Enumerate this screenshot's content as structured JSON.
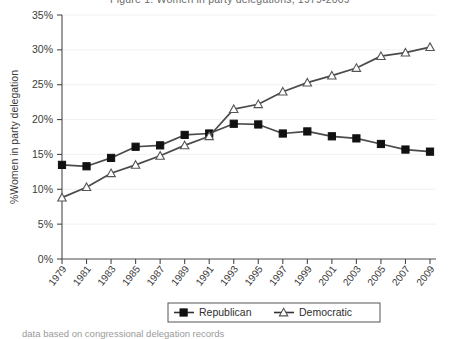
{
  "figure": {
    "title_fragment": "Figure 1. Women in party delegations, 1979-2009",
    "caption_fragment": "data based on congressional delegation records"
  },
  "chart_data": {
    "type": "line",
    "title": "",
    "xlabel": "",
    "ylabel": "%Women in party delegation",
    "x": [
      1979,
      1981,
      1983,
      1985,
      1987,
      1989,
      1991,
      1993,
      1995,
      1997,
      1999,
      2001,
      2003,
      2005,
      2007,
      2009
    ],
    "xtick_labels": [
      "1979",
      "1981",
      "1983",
      "1985",
      "1987",
      "1989",
      "1991",
      "1993",
      "1995",
      "1997",
      "1999",
      "2001",
      "2003",
      "2005",
      "2007",
      "2009"
    ],
    "ytick_labels": [
      "0%",
      "5%",
      "10%",
      "15%",
      "20%",
      "25%",
      "30%",
      "35%"
    ],
    "ytick_values": [
      0,
      5,
      10,
      15,
      20,
      25,
      30,
      35
    ],
    "ylim": [
      0,
      35
    ],
    "xlim": [
      1979,
      2009
    ],
    "grid": true,
    "legend_position": "bottom-center",
    "series": [
      {
        "name": "Republican",
        "marker": "filled-square",
        "color": "#4a4a4a",
        "values": [
          13.5,
          13.3,
          14.5,
          16.1,
          16.3,
          17.8,
          18.0,
          19.4,
          19.3,
          18.0,
          18.3,
          17.6,
          17.3,
          16.5,
          15.7,
          15.4
        ]
      },
      {
        "name": "Democratic",
        "marker": "open-triangle",
        "color": "#4a4a4a",
        "values": [
          8.8,
          10.3,
          12.3,
          13.5,
          14.8,
          16.3,
          17.6,
          21.5,
          22.2,
          24.0,
          25.3,
          26.3,
          27.4,
          29.1,
          29.6,
          30.4
        ]
      }
    ]
  },
  "legend": {
    "items": [
      {
        "label": "Republican",
        "marker": "filled-square"
      },
      {
        "label": "Democratic",
        "marker": "open-triangle"
      }
    ]
  }
}
